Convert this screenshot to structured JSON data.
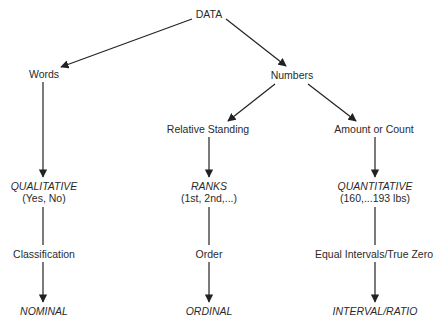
{
  "diagram": {
    "root": "DATA",
    "level1": {
      "left": "Words",
      "right": "Numbers"
    },
    "level2": {
      "middle": "Relative Standing",
      "right": "Amount or Count"
    },
    "columns": [
      {
        "type_label": "QUALITATIVE",
        "type_example": "(Yes, No)",
        "property": "Classification",
        "scale": "NOMINAL"
      },
      {
        "type_label": "RANKS",
        "type_example": "(1st, 2nd,...)",
        "property": "Order",
        "scale": "ORDINAL"
      },
      {
        "type_label": "QUANTITATIVE",
        "type_example": "(160,...193 lbs)",
        "property": "Equal Intervals/True Zero",
        "scale": "INTERVAL/RATIO"
      }
    ],
    "colors": {
      "text": "#2a2a2a",
      "line": "#222222",
      "background": "#ffffff"
    }
  }
}
